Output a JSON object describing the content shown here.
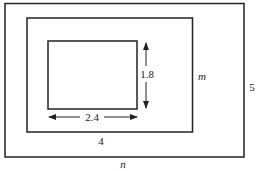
{
  "diagram": {
    "type": "nested-rectangles",
    "rectangles": [
      {
        "name": "outer",
        "width_label": "n",
        "height_label": "5"
      },
      {
        "name": "middle",
        "width_label": "4",
        "height_label": "m"
      },
      {
        "name": "inner",
        "width_label": "2.4",
        "height_label": "1.8"
      }
    ],
    "labels": {
      "inner_width": "2.4",
      "inner_height": "1.8",
      "middle_width": "4",
      "middle_height": "m",
      "outer_width": "n",
      "outer_height": "5"
    },
    "colors": {
      "stroke": "#222222",
      "background": "#ffffff"
    }
  }
}
